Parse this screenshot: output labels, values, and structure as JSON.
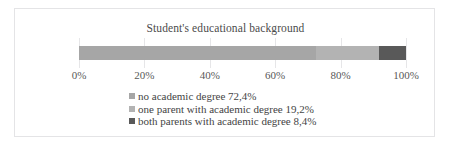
{
  "chart_data": {
    "type": "bar",
    "orientation": "horizontal",
    "stacked": true,
    "title": "Student's educational background",
    "xlabel": "",
    "ylabel": "",
    "xlim": [
      0,
      100
    ],
    "grid": true,
    "legend_position": "bottom-left",
    "categories": [
      "Student's educational background"
    ],
    "tick_labels": [
      "0%",
      "20%",
      "40%",
      "60%",
      "80%",
      "100%"
    ],
    "tick_values": [
      0,
      20,
      40,
      60,
      80,
      100
    ],
    "series": [
      {
        "name": "no academic degree",
        "value": 72.4,
        "value_label": "72,4%",
        "legend_label": "no academic degree 72,4%",
        "color": "#a6a6a6"
      },
      {
        "name": "one parent with academic degree",
        "value": 19.2,
        "value_label": "19,2%",
        "legend_label": "one parent with academic degree 19,2%",
        "color": "#b3b3b3"
      },
      {
        "name": "both parents with academic degree",
        "value": 8.4,
        "value_label": "8,4%",
        "legend_label": "both parents with academic degree 8,4%",
        "color": "#595959"
      }
    ]
  },
  "chart": {
    "title": "Student's educational background",
    "frame_color": "#e4e4e6",
    "gridline_color": "#e6e6e8",
    "axis": {
      "ticks": [
        {
          "label": "0%",
          "pct": 0
        },
        {
          "label": "20%",
          "pct": 20
        },
        {
          "label": "40%",
          "pct": 40
        },
        {
          "label": "60%",
          "pct": 60
        },
        {
          "label": "80%",
          "pct": 80
        },
        {
          "label": "100%",
          "pct": 100
        }
      ]
    },
    "bar": {
      "segments": [
        {
          "label": "no academic degree",
          "pct": 72.4,
          "color": "#a6a6a6"
        },
        {
          "label": "one parent with academic degree",
          "pct": 19.2,
          "color": "#b3b3b3"
        },
        {
          "label": "both parents with academic degree",
          "pct": 8.4,
          "color": "#595959"
        }
      ]
    },
    "legend": {
      "items": [
        {
          "label": "no academic degree 72,4%",
          "color": "#a6a6a6"
        },
        {
          "label": "one parent with academic degree 19,2%",
          "color": "#b3b3b3"
        },
        {
          "label": "both parents with academic degree 8,4%",
          "color": "#595959"
        }
      ]
    }
  }
}
